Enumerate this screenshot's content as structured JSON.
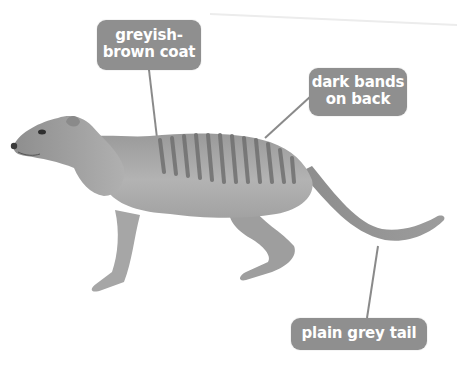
{
  "diagram": {
    "labels": [
      {
        "id": "coat",
        "lines": [
          "greyish-",
          "brown coat"
        ]
      },
      {
        "id": "bands",
        "lines": [
          "dark bands",
          "on back"
        ]
      },
      {
        "id": "tail",
        "lines": [
          "plain grey tail"
        ]
      }
    ],
    "colors": {
      "label_background": "#8f8f8f",
      "label_text": "#ffffff",
      "leader_line": "#8a8a8a",
      "animal_body": "#a9a9a9",
      "animal_bands": "#6f6f6f",
      "background": "#ffffff"
    }
  }
}
